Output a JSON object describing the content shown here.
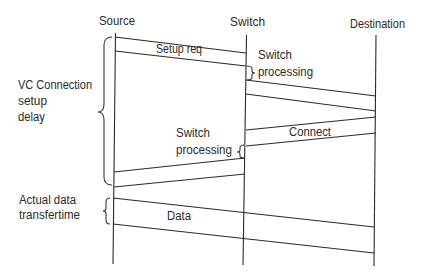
{
  "diagram": {
    "type": "sequence-diagram",
    "participants": [
      {
        "id": "source",
        "label": "Source",
        "x": 115
      },
      {
        "id": "switch",
        "label": "Switch",
        "x": 246
      },
      {
        "id": "destination",
        "label": "Destination",
        "x": 376
      }
    ],
    "messages": {
      "setup_req": {
        "label": "Setup req",
        "from": "Source",
        "to": "Switch"
      },
      "forward_setup": {
        "label": "",
        "from": "Switch",
        "to": "Destination"
      },
      "connect": {
        "label": "Connect",
        "from": "Destination",
        "to": "Switch"
      },
      "forward_connect": {
        "label": "",
        "from": "Switch",
        "to": "Source"
      },
      "data": {
        "label": "Data",
        "from": "Source",
        "to": "Destination"
      }
    },
    "annotations": {
      "switch_processing_1": {
        "line1": "Switch",
        "line2": "processing"
      },
      "switch_processing_2": {
        "line1": "Switch",
        "line2": "processing"
      },
      "vc_setup_delay": {
        "line1": "VC Connection",
        "line2": "setup",
        "line3": "delay"
      },
      "data_transfer": {
        "line1": "Actual data",
        "line2": "transfertime"
      }
    }
  }
}
